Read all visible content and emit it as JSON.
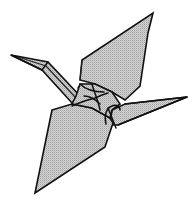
{
  "figure": {
    "style": "black line art with stippled grey fill",
    "colors": {
      "background": "#ffffff",
      "outline": "#111111",
      "fill_light": "#d4d4d4",
      "fill_dot": "#9a9a9a"
    },
    "parts": [
      "head",
      "neck",
      "upper-wing",
      "body-center",
      "tail",
      "lower-wing"
    ]
  }
}
